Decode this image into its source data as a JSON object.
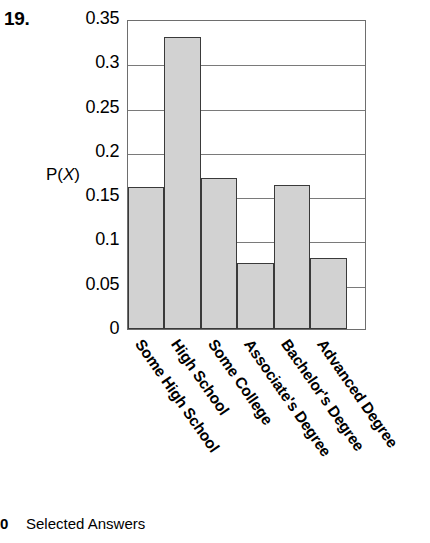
{
  "question_number": "19.",
  "footer": {
    "page_number": "0",
    "text": "Selected Answers"
  },
  "chart_data": {
    "type": "bar",
    "title": "",
    "xlabel": "",
    "ylabel": "P(X)",
    "ylim": [
      0,
      0.35
    ],
    "grid": true,
    "legend": "none",
    "categories": [
      "Some High School",
      "High School",
      "Some College",
      "Associate's Degree",
      "Bachelor's Degree",
      "Advanced Degree"
    ],
    "values": [
      0.16,
      0.33,
      0.17,
      0.075,
      0.163,
      0.08
    ],
    "ytick_labels": [
      "0",
      "0.05",
      "0.1",
      "0.15",
      "0.2",
      "0.25",
      "0.3",
      "0.35"
    ],
    "ytick_values": [
      0,
      0.05,
      0.1,
      0.15,
      0.2,
      0.25,
      0.3,
      0.35
    ],
    "colors": {
      "bar_fill": "#d2d2d2",
      "bar_border": "#3a3a3a",
      "gridline": "#7a7a7a",
      "frame": "#6e6e6e"
    }
  }
}
